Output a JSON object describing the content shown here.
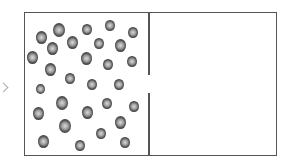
{
  "diagram": {
    "container": {
      "left": 24,
      "top": 12,
      "right": 278,
      "bottom": 157
    },
    "partition": {
      "x": 148,
      "gap_top": 75,
      "gap_bottom": 93
    },
    "left_chamber": {
      "label": "",
      "state": "gas"
    },
    "right_chamber": {
      "label": "",
      "state": "vacuum"
    },
    "colors": {
      "border": "#555555",
      "particle_dark": "#3a3a3a",
      "particle_light": "#d8d8d8"
    },
    "particles": [
      {
        "x": 41,
        "y": 37,
        "r": 5.5
      },
      {
        "x": 59,
        "y": 30,
        "r": 6
      },
      {
        "x": 87,
        "y": 29,
        "r": 5
      },
      {
        "x": 110,
        "y": 25,
        "r": 5
      },
      {
        "x": 133,
        "y": 32,
        "r": 5
      },
      {
        "x": 52,
        "y": 48,
        "r": 5.5
      },
      {
        "x": 72,
        "y": 42,
        "r": 5.5
      },
      {
        "x": 99,
        "y": 43,
        "r": 5
      },
      {
        "x": 120,
        "y": 45,
        "r": 5.5
      },
      {
        "x": 32,
        "y": 57,
        "r": 5.5
      },
      {
        "x": 86,
        "y": 58,
        "r": 5.5
      },
      {
        "x": 108,
        "y": 64,
        "r": 5
      },
      {
        "x": 132,
        "y": 61,
        "r": 5
      },
      {
        "x": 50,
        "y": 69,
        "r": 5.5
      },
      {
        "x": 70,
        "y": 78,
        "r": 5
      },
      {
        "x": 92,
        "y": 84,
        "r": 5
      },
      {
        "x": 119,
        "y": 84,
        "r": 5
      },
      {
        "x": 40,
        "y": 89,
        "r": 4.5
      },
      {
        "x": 62,
        "y": 103,
        "r": 6
      },
      {
        "x": 107,
        "y": 103,
        "r": 5
      },
      {
        "x": 134,
        "y": 106,
        "r": 5
      },
      {
        "x": 38,
        "y": 113,
        "r": 5.5
      },
      {
        "x": 87,
        "y": 112,
        "r": 5.5
      },
      {
        "x": 120,
        "y": 122,
        "r": 5.5
      },
      {
        "x": 65,
        "y": 126,
        "r": 6
      },
      {
        "x": 101,
        "y": 133,
        "r": 5
      },
      {
        "x": 43,
        "y": 141,
        "r": 5.5
      },
      {
        "x": 80,
        "y": 145,
        "r": 5
      },
      {
        "x": 125,
        "y": 142,
        "r": 5
      }
    ]
  }
}
